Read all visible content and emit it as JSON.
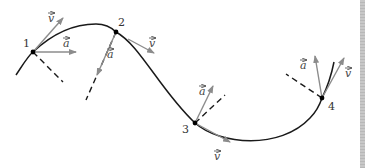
{
  "diagram": {
    "colors": {
      "curve": "#1a1a1a",
      "vector": "#8c8c8c",
      "normal_dashed": "#1a1a1a",
      "point": "#000000",
      "scrollbar": "#c0c0c0"
    },
    "points": [
      {
        "label": "1",
        "v_label": "v",
        "a_label": "a"
      },
      {
        "label": "2",
        "v_label": "v",
        "a_label": "a"
      },
      {
        "label": "3",
        "v_label": "v",
        "a_label": "a"
      },
      {
        "label": "4",
        "v_label": "v",
        "a_label": "a"
      }
    ]
  }
}
